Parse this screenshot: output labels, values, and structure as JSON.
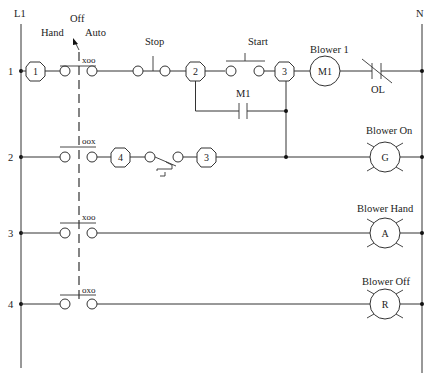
{
  "rails": {
    "left": "L1",
    "right": "N"
  },
  "selector_switch": {
    "positions": {
      "hand": "Hand",
      "off": "Off",
      "auto": "Auto"
    },
    "contacts": [
      {
        "rung": "1",
        "truth": "xoo"
      },
      {
        "rung": "2",
        "truth": "oox"
      },
      {
        "rung": "3",
        "truth": "xoo"
      },
      {
        "rung": "4",
        "truth": "oxo"
      }
    ]
  },
  "rungs": [
    {
      "number": "1",
      "wire_numbers": [
        "1",
        "2",
        "3"
      ],
      "stop_label": "Stop",
      "start_label": "Start",
      "seal_in_label": "M1",
      "load_label": "Blower 1",
      "load_symbol": "M1",
      "overload_label": "OL"
    },
    {
      "number": "2",
      "wire_numbers": [
        "4",
        "3"
      ],
      "device": "float-switch",
      "load_label": "Blower On",
      "load_symbol": "G"
    },
    {
      "number": "3",
      "load_label": "Blower Hand",
      "load_symbol": "A"
    },
    {
      "number": "4",
      "load_label": "Blower Off",
      "load_symbol": "R"
    }
  ]
}
